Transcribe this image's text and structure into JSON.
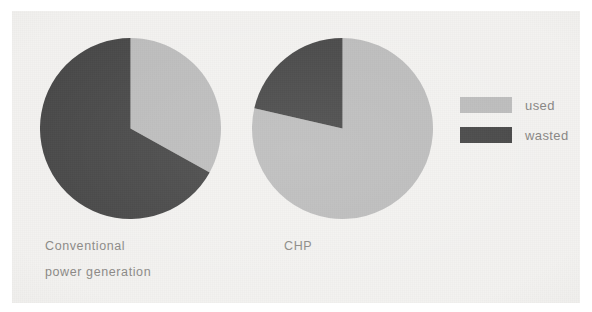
{
  "colors": {
    "used": "#bcbcbc",
    "wasted": "#474747",
    "background": "#f3f2f0",
    "page": "#ffffff",
    "text": "#8c8a87"
  },
  "legend": {
    "position": "right",
    "items": [
      {
        "label": "used",
        "color": "#bcbcbc",
        "swatch_name": "legend-swatch-used"
      },
      {
        "label": "wasted",
        "color": "#474747",
        "swatch_name": "legend-swatch-wasted"
      }
    ]
  },
  "labels": {
    "conventional_line1": "Conventional",
    "conventional_line2": "power generation",
    "chp": "CHP"
  },
  "chart_data": {
    "type": "pie",
    "title": "",
    "subtitle": "",
    "xlabel": "",
    "ylabel": "",
    "grid": false,
    "legend_position": "right",
    "legend_entries": [
      "used",
      "wasted"
    ],
    "charts": [
      {
        "name": "Conventional power generation",
        "label_lines": [
          "Conventional",
          "power generation"
        ],
        "start_angle_deg": 0,
        "direction": "clockwise",
        "slices": [
          {
            "name": "used",
            "value": 33,
            "unit": "%",
            "color": "#bcbcbc",
            "start_deg": 0,
            "end_deg": 119
          },
          {
            "name": "wasted",
            "value": 67,
            "unit": "%",
            "color": "#474747",
            "start_deg": 119,
            "end_deg": 360
          }
        ]
      },
      {
        "name": "CHP",
        "label_lines": [
          "CHP"
        ],
        "start_angle_deg": 0,
        "direction": "clockwise",
        "slices": [
          {
            "name": "used",
            "value": 79,
            "unit": "%",
            "color": "#bcbcbc",
            "start_deg": 0,
            "end_deg": 283
          },
          {
            "name": "wasted",
            "value": 21,
            "unit": "%",
            "color": "#474747",
            "start_deg": 283,
            "end_deg": 360
          }
        ]
      }
    ]
  }
}
